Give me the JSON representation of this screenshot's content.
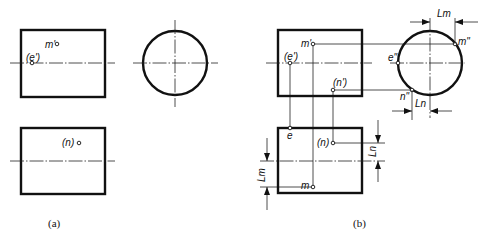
{
  "figure": {
    "panel_a": {
      "caption": "(a)",
      "front_view": {
        "points": [
          {
            "label": "m'",
            "x": 57,
            "y": 44
          },
          {
            "label": "(e')",
            "x": 32,
            "y": 63
          }
        ]
      },
      "side_view": {
        "shape": "circle"
      },
      "top_view": {
        "points": [
          {
            "label": "(n)",
            "x": 79,
            "y": 143
          }
        ]
      }
    },
    "panel_b": {
      "caption": "(b)",
      "front_view": {
        "points": [
          {
            "label": "m'",
            "x": 313,
            "y": 44
          },
          {
            "label": "(e')",
            "x": 290,
            "y": 63
          },
          {
            "label": "(n')",
            "x": 333,
            "y": 90
          }
        ]
      },
      "side_view": {
        "points": [
          {
            "label": "m\"",
            "x": 455,
            "y": 44
          },
          {
            "label": "e\"",
            "x": 398,
            "y": 63
          },
          {
            "label": "n\"",
            "x": 412,
            "y": 90
          }
        ],
        "dimensions": [
          "Lm",
          "Ln"
        ]
      },
      "top_view": {
        "points": [
          {
            "label": "e",
            "x": 290,
            "y": 128
          },
          {
            "label": "(n)",
            "x": 333,
            "y": 143
          },
          {
            "label": "m",
            "x": 313,
            "y": 187
          }
        ],
        "dimensions": [
          "Ln",
          "Lm"
        ]
      }
    }
  }
}
